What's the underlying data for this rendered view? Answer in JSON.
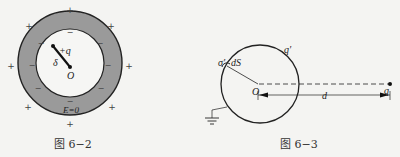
{
  "figures": [
    {
      "id": "fig-6-2",
      "caption": "图 6−2",
      "labels": {
        "charge": "+q",
        "displacement": "δ",
        "center": "O",
        "field": "E=0"
      },
      "outer_charge_sign": "+",
      "inner_charge_sign": "−",
      "colors": {
        "shell_fill": "#9a9a9a",
        "outline": "#222222"
      }
    },
    {
      "id": "fig-6-3",
      "caption": "图 6−3",
      "labels": {
        "surface_density": "σ′",
        "area_element": "dS",
        "induced_charge": "q′",
        "center": "O",
        "distance": "d",
        "point_charge": "q"
      },
      "colors": {
        "outline": "#222222"
      }
    }
  ]
}
